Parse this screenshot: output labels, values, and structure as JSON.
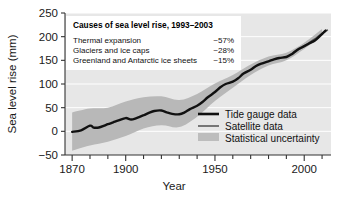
{
  "chart_data": {
    "type": "line",
    "title": "",
    "xlabel": "Year",
    "ylabel": "Sea level rise (mm)",
    "xlim": [
      1866,
      2015
    ],
    "ylim": [
      -50,
      250
    ],
    "xticks": [
      1870,
      1880,
      1890,
      1900,
      1910,
      1920,
      1930,
      1940,
      1950,
      1960,
      1970,
      1980,
      1990,
      2000,
      2010
    ],
    "xticklabels": [
      "1870",
      "",
      "",
      "1900",
      "",
      "",
      "",
      "",
      "1950",
      "",
      "",
      "",
      "",
      "2000",
      ""
    ],
    "yticks": [
      -50,
      0,
      50,
      100,
      150,
      200,
      250
    ],
    "yticklabels": [
      "−50",
      "0",
      "50",
      "100",
      "150",
      "200",
      "250"
    ],
    "grid": "horizontal-white",
    "legend_position": "lower-right-inside",
    "series": [
      {
        "name": "Tide gauge data",
        "style": "thick-black-line",
        "color": "#111111",
        "x": [
          1870,
          1875,
          1880,
          1882,
          1885,
          1888,
          1890,
          1893,
          1896,
          1900,
          1903,
          1906,
          1910,
          1913,
          1916,
          1920,
          1923,
          1926,
          1930,
          1933,
          1936,
          1940,
          1943,
          1946,
          1950,
          1953,
          1956,
          1960,
          1963,
          1966,
          1970,
          1973,
          1976,
          1980,
          1983,
          1986,
          1990,
          1993,
          1996,
          2000,
          2003,
          2006,
          2009,
          2012
        ],
        "y": [
          -1,
          2,
          12,
          8,
          8,
          12,
          15,
          19,
          23,
          28,
          25,
          28,
          34,
          39,
          43,
          44,
          40,
          37,
          36,
          40,
          47,
          54,
          62,
          72,
          83,
          93,
          100,
          105,
          112,
          122,
          130,
          138,
          143,
          148,
          152,
          155,
          157,
          163,
          172,
          180,
          186,
          192,
          202,
          213
        ]
      },
      {
        "name": "Satellite data",
        "style": "medium-gray-line",
        "color": "#555555",
        "x": [
          1993,
          1995,
          1997,
          1999,
          2001,
          2003,
          2005,
          2007,
          2009,
          2011,
          2013
        ],
        "y": [
          163,
          168,
          173,
          177,
          183,
          188,
          193,
          198,
          204,
          209,
          214
        ]
      }
    ],
    "uncertainty": {
      "name": "Statistical uncertainty",
      "color": "#b8b8b8",
      "x": [
        1870,
        1880,
        1890,
        1900,
        1910,
        1920,
        1930,
        1940,
        1950,
        1960,
        1970,
        1980,
        1990,
        2000,
        2010
      ],
      "lower": [
        -41,
        -30,
        -22,
        -10,
        6,
        13,
        9,
        31,
        64,
        92,
        119,
        139,
        150,
        174,
        202
      ],
      "upper": [
        40,
        48,
        50,
        63,
        72,
        74,
        66,
        79,
        101,
        119,
        141,
        158,
        166,
        187,
        216
      ]
    }
  },
  "annotation_box": {
    "title": "Causes of sea level rise, 1993–2003",
    "rows": [
      {
        "label": "Thermal expansion",
        "value": "~57%"
      },
      {
        "label": "Glaciers and ice caps",
        "value": "~28%"
      },
      {
        "label": "Greenland and Antarctic ice sheets",
        "value": "~15%"
      }
    ]
  },
  "legend": {
    "items": [
      {
        "label": "Tide gauge data",
        "marker": "thick-line",
        "color": "#111111"
      },
      {
        "label": "Satellite data",
        "marker": "thin-line",
        "color": "#555555"
      },
      {
        "label": "Statistical uncertainty",
        "marker": "swatch",
        "color": "#bdbdbd"
      }
    ]
  },
  "colors": {
    "plot_background": "#e7e7e7",
    "gridline": "#ffffff",
    "axis": "#333333",
    "band": "#b9b9b9",
    "line": "#111111"
  }
}
